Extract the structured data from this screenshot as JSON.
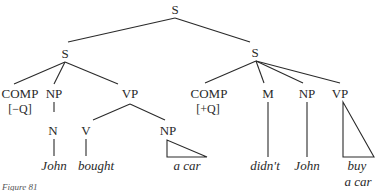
{
  "figure": {
    "caption": "Figure 81",
    "type": "syntax-tree",
    "nodes": {
      "root": "S",
      "left_s": "S",
      "right_s": "S",
      "left_comp": "COMP",
      "left_comp_feature": "[−Q]",
      "left_np": "NP",
      "left_n": "N",
      "left_vp": "VP",
      "left_v": "V",
      "left_obj_np": "NP",
      "right_comp": "COMP",
      "right_comp_feature": "[+Q]",
      "right_m": "M",
      "right_np": "NP",
      "right_vp": "VP"
    },
    "words": {
      "john_left": "John",
      "bought": "bought",
      "a_car_left": "a car",
      "didnt": "didn't",
      "john_right": "John",
      "buy": "buy",
      "a_car_right": "a car"
    }
  }
}
